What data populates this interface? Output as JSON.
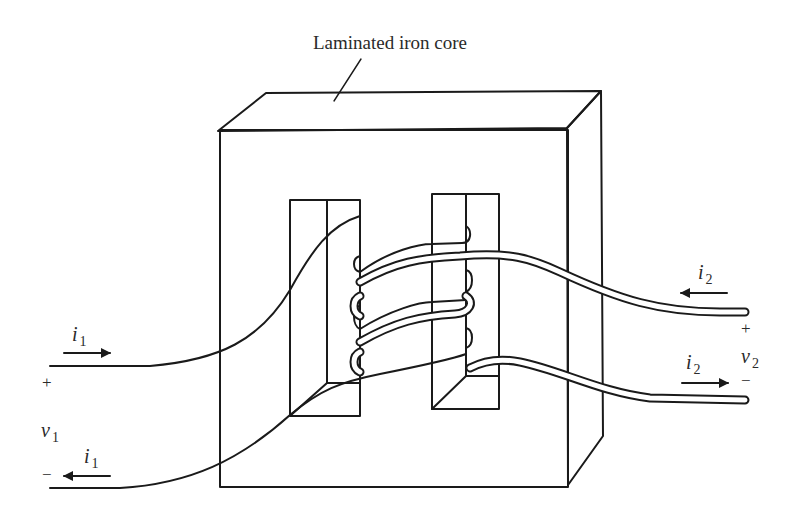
{
  "diagram": {
    "type": "transformer-schematic",
    "title_label": "Laminated iron core",
    "colors": {
      "stroke": "#1a1a1a",
      "text": "#2a2a2a",
      "background": "#ffffff"
    },
    "primary": {
      "current_top": {
        "symbol": "i",
        "subscript": "1",
        "arrow": "right"
      },
      "current_bottom": {
        "symbol": "i",
        "subscript": "1",
        "arrow": "left"
      },
      "voltage": {
        "symbol": "v",
        "subscript": "1"
      },
      "plus": "+",
      "minus": "−"
    },
    "secondary": {
      "current_top": {
        "symbol": "i",
        "subscript": "2",
        "arrow": "left"
      },
      "current_bottom": {
        "symbol": "i",
        "subscript": "2",
        "arrow": "right"
      },
      "voltage": {
        "symbol": "v",
        "subscript": "2"
      },
      "plus": "+",
      "minus": "−"
    }
  }
}
